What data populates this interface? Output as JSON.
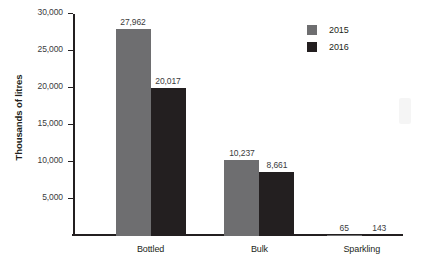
{
  "chart_data": {
    "type": "bar",
    "title": "",
    "subtitle": "",
    "xlabel": "",
    "ylabel": "Thousands of litres",
    "categories": [
      "Bottled",
      "Bulk",
      "Sparkling"
    ],
    "series": [
      {
        "name": "2015",
        "color": "#6e6e70",
        "values": [
          27962,
          10237,
          65
        ],
        "labels": [
          "27,962",
          "10,237",
          "65"
        ]
      },
      {
        "name": "2016",
        "color": "#231f20",
        "values": [
          20017,
          8661,
          143
        ],
        "labels": [
          "20,017",
          "8,661",
          "143"
        ]
      }
    ],
    "ylim": [
      0,
      30000
    ],
    "y_ticks": [
      0,
      5000,
      10000,
      15000,
      20000,
      25000,
      30000
    ],
    "y_tick_labels": [
      "",
      "5,000",
      "10,000",
      "15,000",
      "20,000",
      "25,000",
      "30,000"
    ],
    "grid": false,
    "legend": {
      "position": "top-right",
      "entries": [
        {
          "label": "2015",
          "color": "#6e6e70"
        },
        {
          "label": "2016",
          "color": "#231f20"
        }
      ]
    },
    "colors": {
      "series_2015": "#6e6e70",
      "series_2016": "#231f20",
      "axis": "#231f20",
      "tick_text": "#3b3b3d",
      "background": "#ffffff"
    }
  }
}
